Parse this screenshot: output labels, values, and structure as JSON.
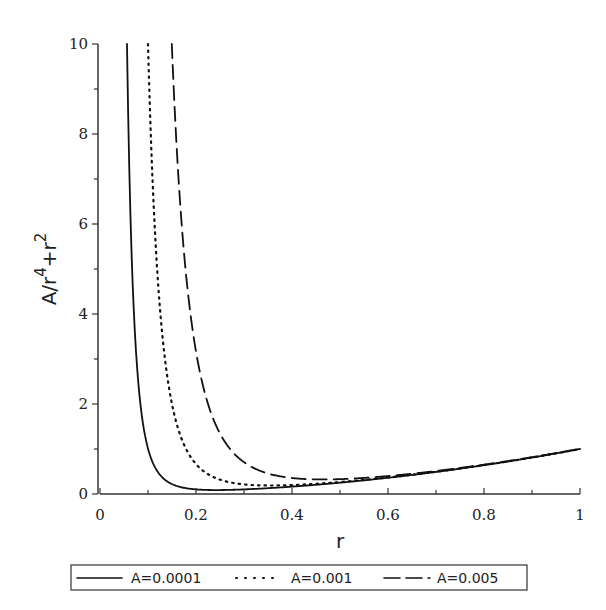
{
  "chart_data": {
    "type": "line",
    "title": "",
    "xlabel": "r",
    "ylabel": "A/r^4+r^2",
    "ylabel_parts": {
      "base1": "A/r",
      "exp1": "4",
      "mid": "+r",
      "exp2": "2"
    },
    "xlim": [
      0,
      1
    ],
    "ylim": [
      0,
      10
    ],
    "grid": false,
    "legend_position": "bottom",
    "x_ticks": [
      0,
      0.2,
      0.4,
      0.6,
      0.8,
      1
    ],
    "x_tick_labels": [
      "0",
      "0.2",
      "0.4",
      "0.6",
      "0.8",
      "1"
    ],
    "y_ticks": [
      0,
      2,
      4,
      6,
      8,
      10
    ],
    "y_tick_labels": [
      "0",
      "2",
      "4",
      "6",
      "8",
      "10"
    ],
    "function": "A/r^4 + r^2",
    "series": [
      {
        "name": "A=0.0001",
        "A": 0.0001,
        "style": "solid",
        "color": "#111111"
      },
      {
        "name": "A=0.001",
        "A": 0.001,
        "style": "dotted",
        "color": "#111111"
      },
      {
        "name": "A=0.005",
        "A": 0.005,
        "style": "dashed",
        "color": "#111111"
      }
    ]
  }
}
